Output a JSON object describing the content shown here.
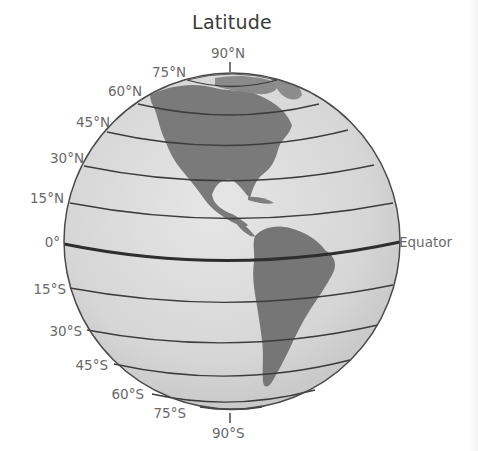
{
  "title": "Latitude",
  "colors": {
    "label_text": "#6a6a6a",
    "title_text": "#3a3a3a",
    "ocean": "#d9d9d9",
    "land": "#7d7d7d",
    "latitude_line": "#3c3c3c",
    "equator_line": "#2e2e2e"
  },
  "labels": {
    "north_pole": "90°N",
    "n75": "75°N",
    "n60": "60°N",
    "n45": "45°N",
    "n30": "30°N",
    "n15": "15°N",
    "equator_deg": "0°",
    "equator_name": "Equator",
    "s15": "15°S",
    "s30": "30°S",
    "s45": "45°S",
    "s60": "60°S",
    "s75": "75°S",
    "south_pole": "90°S"
  },
  "globe": {
    "center_x": 232,
    "center_y": 241,
    "radius": 168,
    "visible_continents": [
      "North America",
      "South America"
    ]
  }
}
